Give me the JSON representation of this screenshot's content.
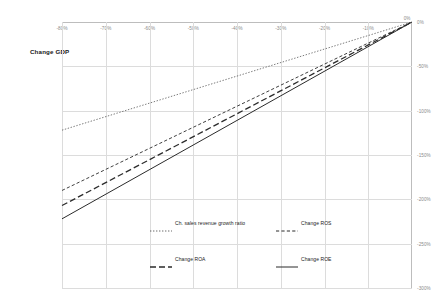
{
  "chart_data": {
    "type": "line",
    "title": "",
    "xlabel": "Change GDP",
    "ylabel": "",
    "xlim": [
      -80,
      0
    ],
    "ylim": [
      -300,
      0
    ],
    "xticks": [
      "-80%",
      "-70%",
      "-60%",
      "-50%",
      "-40%",
      "-30%",
      "-20%",
      "-10%",
      "0%"
    ],
    "xtick_values": [
      -80,
      -70,
      -60,
      -50,
      -40,
      -30,
      -20,
      -10,
      0
    ],
    "yticks": [
      "0%",
      "-50%",
      "-100%",
      "-150%",
      "-200%",
      "-250%",
      "-300%"
    ],
    "ytick_values": [
      0,
      -50,
      -100,
      -150,
      -200,
      -250,
      -300
    ],
    "grid": true,
    "x_axis_position": "top",
    "y_axis_position": "right",
    "legend_position": "bottom",
    "x": [
      -80,
      0
    ],
    "series": [
      {
        "name": "Ch. sales revenue growth ratio",
        "style": "dotted",
        "color": "#404040",
        "values": [
          -122,
          0
        ]
      },
      {
        "name": "Change ROS",
        "style": "dashed",
        "color": "#404040",
        "values": [
          -190,
          0
        ]
      },
      {
        "name": "Change ROA",
        "style": "dashed-long",
        "color": "#2b2b2b",
        "values": [
          -207,
          0
        ]
      },
      {
        "name": "Change ROE",
        "style": "solid",
        "color": "#2b2b2b",
        "values": [
          -222,
          0
        ]
      }
    ]
  },
  "axis": {
    "title": "Change GDP",
    "xticks": [
      "-80%",
      "-70%",
      "-60%",
      "-50%",
      "-40%",
      "-30%",
      "-20%",
      "-10%",
      "0%"
    ],
    "yticks": [
      "0%",
      "-50%",
      "-100%",
      "-150%",
      "-200%",
      "-250%",
      "-300%"
    ],
    "corner_zero": "0%"
  },
  "legend": {
    "items": [
      {
        "label": "Ch. sales revenue growth ratio",
        "style": "dotted"
      },
      {
        "label": "Change ROS",
        "style": "dashed"
      },
      {
        "label": "Change ROA",
        "style": "dashed-long"
      },
      {
        "label": "Change ROE",
        "style": "solid"
      }
    ]
  }
}
